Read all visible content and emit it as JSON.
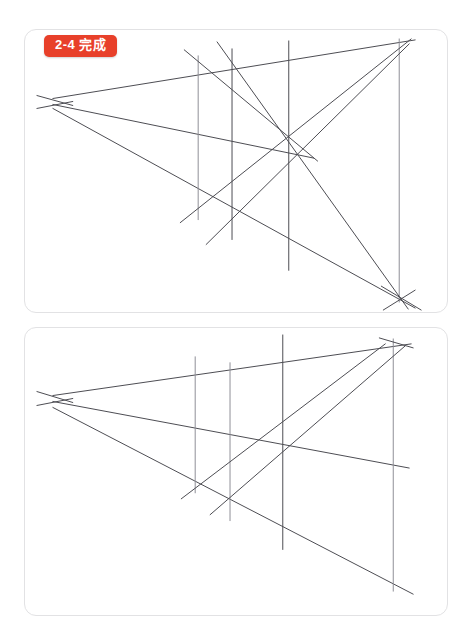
{
  "page": {
    "top_cut_text": "",
    "background_color": "#ffffff"
  },
  "style": {
    "line_color": "#4c4c52",
    "line_color_light": "#8e8e96",
    "card_border_color": "#e2e2e4",
    "badge_bg": "#e8402a",
    "badge_text_color": "#ffffff"
  },
  "cards": [
    {
      "id": "card-1",
      "badge_label": "2-4 完成",
      "caption": "",
      "geometry": {
        "vanishing_point": [
          34,
          74
        ],
        "convergence_point_right": [
          374,
          267
        ],
        "verticals": [
          {
            "x": 174,
            "y1": 26,
            "y2": 190
          },
          {
            "x": 208,
            "y1": 20,
            "y2": 210
          },
          {
            "x": 265,
            "y1": 12,
            "y2": 240
          },
          {
            "x": 376,
            "y1": 10,
            "y2": 272
          }
        ],
        "rays": [
          {
            "from": [
              30,
              70
            ],
            "to": [
              382,
              12
            ]
          },
          {
            "from": [
              30,
              76
            ],
            "to": [
              288,
              128
            ]
          },
          {
            "from": [
              30,
              80
            ],
            "to": [
              386,
              276
            ]
          }
        ],
        "diagonals": [
          {
            "from": [
              158,
              190
            ],
            "to": [
              385,
              12
            ]
          },
          {
            "from": [
              185,
              212
            ],
            "to": [
              383,
              15
            ]
          },
          {
            "from": [
              196,
              14
            ],
            "to": [
              378,
              272
            ]
          },
          {
            "from": [
              163,
              22
            ],
            "to": [
              290,
              130
            ]
          }
        ]
      }
    },
    {
      "id": "card-2",
      "badge_label": "",
      "caption": "",
      "geometry": {
        "vanishing_point": [
          34,
          73
        ],
        "convergence_point_right": [
          370,
          278
        ],
        "verticals": [
          {
            "x": 171,
            "y1": 30,
            "y2": 165
          },
          {
            "x": 206,
            "y1": 36,
            "y2": 192
          },
          {
            "x": 259,
            "y1": 8,
            "y2": 222
          },
          {
            "x": 370,
            "y1": 12,
            "y2": 263
          }
        ],
        "rays": [
          {
            "from": [
              30,
              68
            ],
            "to": [
              378,
              18
            ]
          },
          {
            "from": [
              30,
              74
            ],
            "to": [
              380,
              138
            ]
          },
          {
            "from": [
              30,
              80
            ],
            "to": [
              384,
              264
            ]
          }
        ],
        "diagonals": [
          {
            "from": [
              160,
              168
            ],
            "to": [
              358,
              18
            ]
          },
          {
            "from": [
              190,
              184
            ],
            "to": [
              378,
              20
            ]
          }
        ]
      }
    }
  ]
}
